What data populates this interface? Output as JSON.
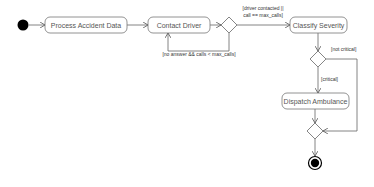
{
  "diagram": {
    "type": "uml-activity",
    "nodes": {
      "start": {
        "kind": "initial"
      },
      "process": {
        "label": "Process Accident Data"
      },
      "contact": {
        "label": "Contact Driver"
      },
      "decision_contact": {
        "kind": "decision"
      },
      "classify": {
        "label": "Classify Severity"
      },
      "decision_severity": {
        "kind": "decision"
      },
      "dispatch": {
        "label": "Dispatch Ambulance"
      },
      "merge": {
        "kind": "merge"
      },
      "end": {
        "kind": "final"
      }
    },
    "guards": {
      "retry": "[no answer && calls < max_calls]",
      "contacted_line1": "[driver contacted ||",
      "contacted_line2": "call == max_calls]",
      "not_critical": "[not critical]",
      "critical": "[critical]"
    },
    "edges": [
      {
        "from": "start",
        "to": "process"
      },
      {
        "from": "process",
        "to": "contact"
      },
      {
        "from": "contact",
        "to": "decision_contact"
      },
      {
        "from": "decision_contact",
        "to": "contact",
        "guard": "[no answer && calls < max_calls]"
      },
      {
        "from": "decision_contact",
        "to": "classify",
        "guard": "[driver contacted || call == max_calls]"
      },
      {
        "from": "classify",
        "to": "decision_severity"
      },
      {
        "from": "decision_severity",
        "to": "dispatch",
        "guard": "[critical]"
      },
      {
        "from": "decision_severity",
        "to": "merge",
        "guard": "[not critical]"
      },
      {
        "from": "dispatch",
        "to": "merge"
      },
      {
        "from": "merge",
        "to": "end"
      }
    ],
    "colors": {
      "stroke": "#555555",
      "fill": "#ffffff",
      "initial": "#000000"
    }
  }
}
